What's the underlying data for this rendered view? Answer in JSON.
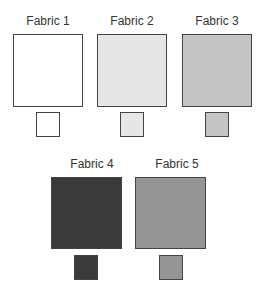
{
  "fabrics": [
    {
      "label": "Fabric 1",
      "color": "#ffffff"
    },
    {
      "label": "Fabric 2",
      "color": "#e6e6e6"
    },
    {
      "label": "Fabric 3",
      "color": "#c4c4c4"
    },
    {
      "label": "Fabric 4",
      "color": "#3a3a3a"
    },
    {
      "label": "Fabric 5",
      "color": "#959595"
    }
  ]
}
